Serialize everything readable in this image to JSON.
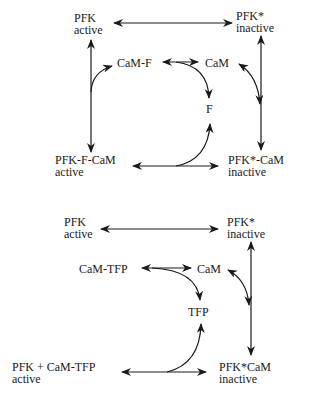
{
  "diagram": {
    "top": {
      "pfk": {
        "name": "PFK",
        "state": "active"
      },
      "pfk_star": {
        "name": "PFK*",
        "state": "inactive"
      },
      "cam_f": {
        "name": "CaM-F"
      },
      "cam": {
        "name": "CaM"
      },
      "f": {
        "name": "F"
      },
      "pfk_f_cam": {
        "name": "PFK-F-CaM",
        "state": "active"
      },
      "pfk_star_cam": {
        "name": "PFK*-CaM",
        "state": "inactive"
      }
    },
    "bottom": {
      "pfk": {
        "name": "PFK",
        "state": "active"
      },
      "pfk_star": {
        "name": "PFK*",
        "state": "inactive"
      },
      "cam_tfp": {
        "name": "CaM-TFP"
      },
      "cam": {
        "name": "CaM"
      },
      "tfp": {
        "name": "TFP"
      },
      "pfk_cam_tfp": {
        "name": "PFK + CaM-TFP",
        "state": "active"
      },
      "pfk_star_cam": {
        "name": "PFK*CaM",
        "state": "inactive"
      }
    },
    "colors": {
      "ink": "#1a1a1a",
      "background": "#ffffff"
    }
  }
}
